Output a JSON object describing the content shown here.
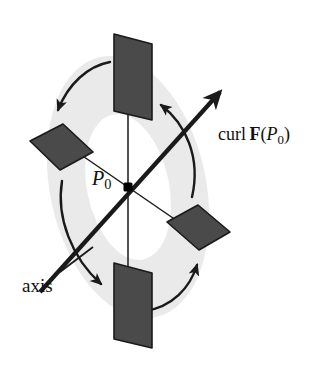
{
  "figure": {
    "background_color": "#ffffff"
  },
  "labels": {
    "axis": "axis",
    "point": {
      "symbol": "P",
      "subscript": "0"
    },
    "curl": {
      "operator": "curl",
      "field": "F",
      "open_paren": "(",
      "arg_symbol": "P",
      "arg_subscript": "0",
      "close_paren": ")"
    }
  },
  "colors": {
    "paddle_fill": "#4a4a4a",
    "paddle_stroke": "#1a1a1a",
    "torus_fill": "#eaeaea",
    "line": "#1a1a1a",
    "text": "#101010",
    "center_dot": "#000000"
  },
  "geometry": {
    "center": {
      "x": 128,
      "y": 187
    },
    "torus": {
      "outer_rx": 78,
      "outer_ry": 133,
      "inner_rx": 41,
      "inner_ry": 74,
      "rotation_deg": -12
    },
    "axis": {
      "start": {
        "x": 40,
        "y": 292
      },
      "end": {
        "x": 222,
        "y": 90
      },
      "stroke_width": 4.2,
      "arrow_at": "end"
    },
    "spoke_vertical": {
      "x1": 128,
      "y1": 60,
      "x2": 128,
      "y2": 312,
      "stroke_width": 1.4
    },
    "spoke_diagonal": {
      "x1": 60,
      "y1": 140,
      "x2": 200,
      "y2": 236,
      "stroke_width": 1.4
    },
    "axis_label_leader": {
      "x1": 62,
      "y1": 272,
      "x2": 92,
      "y2": 248
    }
  },
  "paddles": [
    {
      "name": "paddle-top",
      "points": "114,34 152,44 152,120 114,111",
      "orientation": "upper vane, plane parallel to axis"
    },
    {
      "name": "paddle-bottom",
      "points": "114,263 152,273 152,348 114,339",
      "orientation": "lower vane, plane parallel to axis"
    },
    {
      "name": "paddle-left",
      "points": "30,140 62,124 92,152 59,170",
      "orientation": "left vane, foreshortened"
    },
    {
      "name": "paddle-right",
      "points": "168,222 198,205 230,232 198,250",
      "orientation": "right vane, foreshortened"
    }
  ],
  "rotation_arrows": [
    {
      "name": "rotation-arrow-upper-left",
      "path": "M 110,62 C 88,66 68,84 58,110",
      "direction": "counterclockwise sweep down-left",
      "arrow_at": "end"
    },
    {
      "name": "rotation-arrow-lower-left",
      "path": "M 62,181 C 57,216 72,258 100,283",
      "direction": "sweep down-right",
      "arrow_at": "end"
    },
    {
      "name": "rotation-arrow-lower-right",
      "path": "M 146,310 C 172,306 190,288 196,264",
      "direction": "sweep up-right",
      "arrow_at": "end"
    },
    {
      "name": "rotation-arrow-upper-right",
      "path": "M 192,196 C 200,158 186,124 160,104",
      "direction": "sweep up-left",
      "arrow_at": "end"
    }
  ]
}
